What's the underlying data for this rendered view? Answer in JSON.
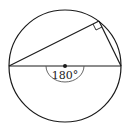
{
  "diagram": {
    "angle_label": "180°",
    "elements": [
      "circle",
      "diameter",
      "center-point",
      "inscribed-triangle",
      "right-angle-marker",
      "semicircle-arc-marker"
    ],
    "colors": {
      "stroke": "#1a1a1a",
      "arc": "#555555",
      "background": "#ffffff"
    }
  }
}
